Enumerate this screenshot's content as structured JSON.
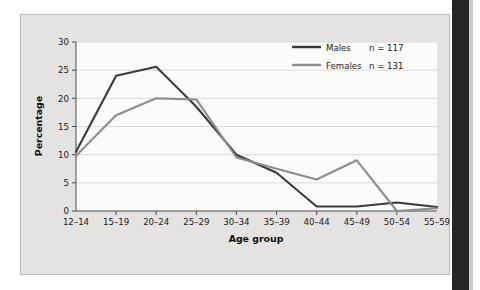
{
  "figure": {
    "background_color": "#e4e3e1",
    "plot_background_color": "#fbfbfa",
    "binding_color": "#252525"
  },
  "chart_data": {
    "type": "line",
    "title": "",
    "xlabel": "Age group",
    "ylabel": "Percentage",
    "categories": [
      "12–14",
      "15–19",
      "20–24",
      "25–29",
      "30–34",
      "35–39",
      "40–44",
      "45–49",
      "50–54",
      "55–59"
    ],
    "ylim": [
      0,
      30
    ],
    "yticks": [
      0,
      5,
      10,
      15,
      20,
      25,
      30
    ],
    "ytick_labels": [
      "0",
      "5",
      "10",
      "15",
      "20",
      "25",
      "30"
    ],
    "grid": "horizontal",
    "legend_position": "top-right",
    "series": [
      {
        "name": "Males",
        "n_label": "n = 117",
        "n": 117,
        "color": "#3a3a3a",
        "values": [
          10.5,
          24.0,
          25.6,
          18.5,
          10.0,
          6.8,
          0.8,
          0.8,
          1.5,
          0.7
        ]
      },
      {
        "name": "Females",
        "n_label": "n = 131",
        "n": 131,
        "color": "#8d8d8d",
        "values": [
          9.8,
          17.0,
          20.0,
          19.8,
          9.5,
          7.5,
          5.6,
          9.0,
          0.0,
          0.5
        ]
      }
    ]
  },
  "legend": {
    "entries": [
      {
        "label": "Males",
        "n_label": "n = 117"
      },
      {
        "label": "Females",
        "n_label": "n = 131"
      }
    ]
  }
}
